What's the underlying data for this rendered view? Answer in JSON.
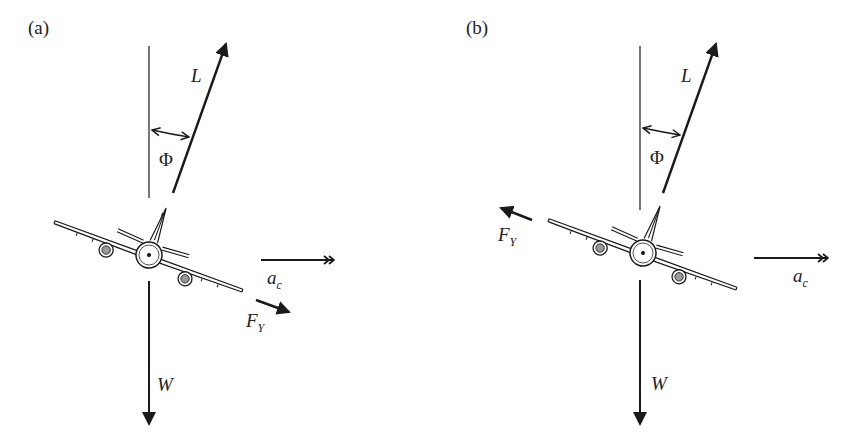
{
  "figure": {
    "panels": [
      {
        "id": "a",
        "label": "(a)",
        "bank_angle_label": "Φ",
        "forces": {
          "lift": "L",
          "weight": "W",
          "side_force": "F",
          "side_force_sub": "Y",
          "centripetal_accel": "a",
          "centripetal_accel_sub": "c"
        },
        "side_force_direction": "down-right"
      },
      {
        "id": "b",
        "label": "(b)",
        "bank_angle_label": "Φ",
        "forces": {
          "lift": "L",
          "weight": "W",
          "side_force": "F",
          "side_force_sub": "Y",
          "centripetal_accel": "a",
          "centripetal_accel_sub": "c"
        },
        "side_force_direction": "up-left"
      }
    ],
    "colors": {
      "ink": "#1a1a1a",
      "engine_fill": "#9a9a9a",
      "background": "#ffffff"
    }
  }
}
